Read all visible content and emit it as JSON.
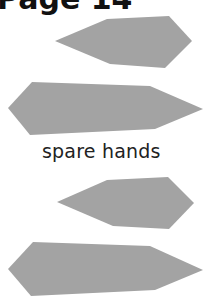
{
  "header": {
    "title": "Page 14"
  },
  "caption": {
    "text": "spare hands"
  },
  "colors": {
    "shape_fill": "#a3a3a3",
    "text": "#111111",
    "background": "#ffffff"
  },
  "shapes": [
    {
      "name": "short-hand-1",
      "points": "55,41 107,19 169,16 192,41 165,68 110,64"
    },
    {
      "name": "long-hand-1",
      "points": "8,108 32,82 150,86 203,109 155,129 30,135"
    },
    {
      "name": "short-hand-2",
      "points": "57,202 107,180 168,177 194,203 169,229 113,226"
    },
    {
      "name": "long-hand-2",
      "points": "8,269 33,242 150,246 203,270 155,290 31,296"
    }
  ]
}
